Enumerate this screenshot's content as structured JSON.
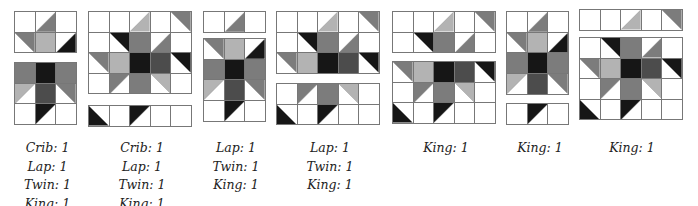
{
  "colors": {
    "white": "#ffffff",
    "light": "#b3b3b3",
    "med": "#7c7c7c",
    "dark": "#4c4c4c",
    "black": "#161616",
    "grid": "#777777"
  },
  "patterns": {
    "narrow": [
      [
        [
          "W"
        ],
        [
          "T",
          "med",
          "br"
        ],
        [
          "W"
        ]
      ],
      [
        [
          "T",
          "med",
          "tr"
        ],
        [
          "S",
          "light"
        ],
        [
          "T",
          "black",
          "br"
        ]
      ],
      [
        [
          "S",
          "med"
        ],
        [
          "S",
          "black"
        ],
        [
          "S",
          "med"
        ]
      ],
      [
        [
          "T",
          "light",
          "tl"
        ],
        [
          "S",
          "dark"
        ],
        [
          "T",
          "med",
          "tr"
        ]
      ],
      [
        [
          "W"
        ],
        [
          "T",
          "black",
          "tl"
        ],
        [
          "W"
        ]
      ]
    ],
    "wide": [
      [
        [
          "W"
        ],
        [
          "W"
        ],
        [
          "T",
          "light",
          "br"
        ],
        [
          "W"
        ],
        [
          "T",
          "med",
          "tr"
        ]
      ],
      [
        [
          "W"
        ],
        [
          "T",
          "black",
          "tr"
        ],
        [
          "S",
          "med"
        ],
        [
          "T",
          "med",
          "br"
        ],
        [
          "W"
        ]
      ],
      [
        [
          "T",
          "med",
          "tr"
        ],
        [
          "S",
          "light"
        ],
        [
          "S",
          "black"
        ],
        [
          "S",
          "dark"
        ],
        [
          "T",
          "black",
          "tr"
        ]
      ],
      [
        [
          "W"
        ],
        [
          "T",
          "med",
          "tl"
        ],
        [
          "S",
          "med"
        ],
        [
          "T",
          "light",
          "tr"
        ],
        [
          "W"
        ]
      ],
      [
        [
          "T",
          "black",
          "bl"
        ],
        [
          "W"
        ],
        [
          "T",
          "black",
          "tl"
        ],
        [
          "W"
        ],
        [
          "W"
        ]
      ]
    ]
  },
  "blocks": [
    {
      "id": "block-1",
      "pattern": "narrow",
      "pieces": [
        {
          "x": 14,
          "y": 11,
          "rows": [
            0,
            1
          ],
          "cell": 20.7
        },
        {
          "x": 14,
          "y": 62,
          "rows": [
            2,
            4
          ],
          "cell": 20.7
        }
      ],
      "labels": [
        "Crib: 1",
        "Lap: 1",
        "Twin: 1",
        "King: 1"
      ],
      "label_x": 10,
      "label_w": 75
    },
    {
      "id": "block-2",
      "pattern": "wide",
      "pieces": [
        {
          "x": 88,
          "y": 11,
          "rows": [
            0,
            3
          ],
          "cell": 20.6
        },
        {
          "x": 88,
          "y": 105,
          "rows": [
            4,
            4
          ],
          "cell": 20.6
        }
      ],
      "labels": [
        "Crib: 1",
        "Lap: 1",
        "Twin: 1",
        "King: 1"
      ],
      "label_x": 102,
      "label_w": 80
    },
    {
      "id": "block-3",
      "pattern": "narrow",
      "pieces": [
        {
          "x": 203,
          "y": 11,
          "rows": [
            0,
            0
          ],
          "cell": 20.7
        },
        {
          "x": 203,
          "y": 38,
          "rows": [
            1,
            4
          ],
          "cell": 20.7
        }
      ],
      "labels": [
        "Lap: 1",
        "Twin: 1",
        "King: 1"
      ],
      "label_x": 196,
      "label_w": 80
    },
    {
      "id": "block-4",
      "pattern": "wide",
      "pieces": [
        {
          "x": 276,
          "y": 11,
          "rows": [
            0,
            2
          ],
          "cell": 20.6
        },
        {
          "x": 276,
          "y": 83,
          "rows": [
            3,
            4
          ],
          "cell": 20.6
        }
      ],
      "labels": [
        "Lap: 1",
        "Twin: 1",
        "King: 1"
      ],
      "label_x": 290,
      "label_w": 80
    },
    {
      "id": "block-5",
      "pattern": "wide",
      "pieces": [
        {
          "x": 392,
          "y": 11,
          "rows": [
            0,
            1
          ],
          "cell": 20.6
        },
        {
          "x": 392,
          "y": 61,
          "rows": [
            2,
            4
          ],
          "cell": 20.6
        }
      ],
      "labels": [
        "King: 1"
      ],
      "label_x": 406,
      "label_w": 80
    },
    {
      "id": "block-6",
      "pattern": "narrow",
      "pieces": [
        {
          "x": 506,
          "y": 11,
          "rows": [
            0,
            3
          ],
          "cell": 20.7
        },
        {
          "x": 506,
          "y": 103,
          "rows": [
            4,
            4
          ],
          "cell": 20.7
        }
      ],
      "labels": [
        "King: 1"
      ],
      "label_x": 500,
      "label_w": 80
    },
    {
      "id": "block-7",
      "pattern": "wide",
      "pieces": [
        {
          "x": 579,
          "y": 9,
          "rows": [
            0,
            0
          ],
          "cell": 20.6
        },
        {
          "x": 579,
          "y": 37,
          "rows": [
            1,
            4
          ],
          "cell": 20.6
        }
      ],
      "labels": [
        "King: 1"
      ],
      "label_x": 592,
      "label_w": 80
    }
  ],
  "label_top": 139
}
